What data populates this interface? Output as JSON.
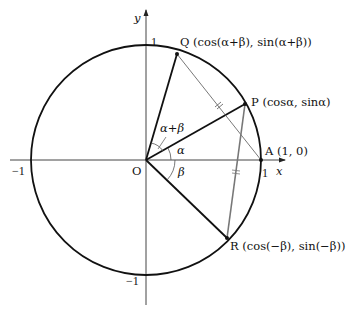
{
  "diagram": {
    "type": "unit-circle-angle-sum",
    "axes": {
      "x_label": "x",
      "y_label": "y",
      "origin_label": "O",
      "ticks": {
        "x_pos": "1",
        "x_neg": "−1",
        "y_pos": "1",
        "y_neg": "−1"
      }
    },
    "points": {
      "Q": {
        "name": "Q",
        "coords": "(cos(α+β), sin(α+β))"
      },
      "P": {
        "name": "P",
        "coords": "(cosα, sinα)"
      },
      "A": {
        "name": "A",
        "coords": "(1, 0)"
      },
      "R": {
        "name": "R",
        "coords": "(cos(−β), sin(−β))"
      }
    },
    "angles": {
      "alpha_plus_beta": "α+β",
      "alpha": "α",
      "beta": "β"
    },
    "colors": {
      "stroke": "#111111",
      "gray_segment": "#777777",
      "thin_segment": "#555555",
      "axis": "#333333"
    }
  }
}
